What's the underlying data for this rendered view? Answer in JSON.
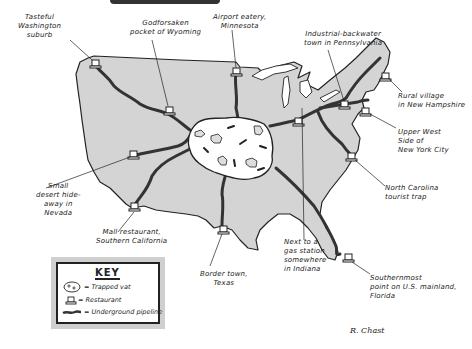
{
  "labels": {
    "washington": "Tasteful\nWashington\nsuburb",
    "wyoming": "Godforsaken\npocket of Wyoming",
    "minnesota": "Airport eatery,\nMinnesota",
    "pennsylvania": "Industrial-backwater\ntown in Pennsylvania",
    "new_hampshire": "Rural village\nin New Hampshire",
    "new_york": "Upper West\nSide of\nNew York City",
    "north_carolina": "North Carolina\ntourist trap",
    "nevada": "Small\ndesert hide-\naway in\nNevada",
    "california": "Mall restaurant,\nSouthern California",
    "texas": "Border town,\nTexas",
    "indiana": "Next to a\ngas station\nsomewhere\nin Indiana",
    "florida": "Southernmost\npoint on U.S. mainland,\nFlorida"
  },
  "key": {
    "title": "KEY",
    "items": [
      {
        "icon": "trapped-vat-icon",
        "label": "= Trapped vat"
      },
      {
        "icon": "restaurant-icon",
        "label": "= Restaurant"
      },
      {
        "icon": "pipeline-icon",
        "label": "= Underground pipeline"
      }
    ]
  },
  "signature": "R. Chast",
  "colors": {
    "land": "#d4d4d4",
    "outline": "#222222",
    "pipeline": "#333333",
    "vat": "#ffffff",
    "key_shadow": "#cfcfcf"
  }
}
